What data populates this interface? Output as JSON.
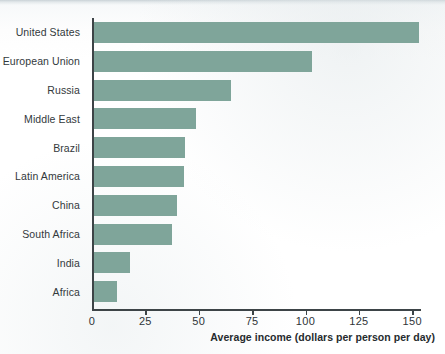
{
  "chart_data": {
    "type": "bar",
    "orientation": "horizontal",
    "title": "",
    "subtitle": "",
    "xlabel": "Average income (dollars per person per day)",
    "ylabel": "",
    "categories": [
      "United States",
      "European Union",
      "Russia",
      "Middle East",
      "Brazil",
      "Latin America",
      "China",
      "South Africa",
      "India",
      "Africa"
    ],
    "values": [
      152,
      102,
      64,
      48,
      42.5,
      42,
      39,
      36.5,
      17,
      11
    ],
    "xlim": [
      0,
      160
    ],
    "xticks": [
      0,
      25,
      50,
      75,
      100,
      125,
      150
    ],
    "xtick_labels": [
      "0",
      "25",
      "50",
      "75",
      "100",
      "125",
      "150"
    ],
    "grid": false,
    "legend": null,
    "legend_position": "none",
    "series": [
      {
        "name": "Average income",
        "values": [
          152,
          102,
          64,
          48,
          42.5,
          42,
          39,
          36.5,
          17,
          11
        ]
      }
    ],
    "annotations": []
  },
  "style": {
    "bar_color": "#7fa59a",
    "axis_color": "#3d4447",
    "label_color": "#33393c",
    "background": "#ffffff"
  }
}
